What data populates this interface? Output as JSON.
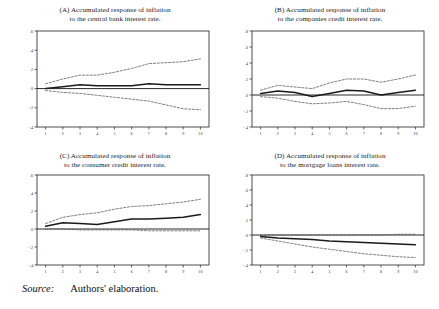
{
  "figure": {
    "source_label": "Source:",
    "source_value": "Authors' elaboration.",
    "background": "#ffffff",
    "line_color": "#1a1a1a",
    "band_color": "#555555"
  },
  "chart_data": [
    {
      "id": "A",
      "type": "line",
      "title_line1": "(A) Accumulated response of inflation",
      "title_line2": "to the central bank interest rate.",
      "xlabel": "",
      "ylabel": "",
      "x": [
        1,
        2,
        3,
        4,
        5,
        6,
        7,
        8,
        9,
        10
      ],
      "xtick_labels": [
        "1",
        "2",
        "3",
        "4",
        "5",
        "6",
        "7",
        "8",
        "9",
        "10"
      ],
      "ytick_labels": [
        ".6",
        ".4",
        ".2",
        ".0",
        "-.2",
        "-.4"
      ],
      "ylim": [
        -0.4,
        0.6
      ],
      "xlim": [
        0.5,
        10.5
      ],
      "grid": false,
      "legend": "none",
      "zero_line": 0.0,
      "series": [
        {
          "name": "Upper 2 S.E. band",
          "style": "dashed",
          "values": [
            0.05,
            0.1,
            0.14,
            0.14,
            0.17,
            0.21,
            0.26,
            0.27,
            0.28,
            0.31
          ]
        },
        {
          "name": "Accumulated response",
          "style": "solid",
          "values": [
            0.0,
            0.02,
            0.04,
            0.03,
            0.03,
            0.03,
            0.05,
            0.04,
            0.04,
            0.04
          ]
        },
        {
          "name": "Lower 2 S.E. band",
          "style": "dashed",
          "values": [
            -0.02,
            -0.04,
            -0.05,
            -0.07,
            -0.09,
            -0.11,
            -0.13,
            -0.17,
            -0.21,
            -0.22
          ]
        }
      ]
    },
    {
      "id": "B",
      "type": "line",
      "title_line1": "(B) Accumulated response of inflation",
      "title_line2": "to the companies credit interest rate.",
      "xlabel": "",
      "ylabel": "",
      "x": [
        1,
        2,
        3,
        4,
        5,
        6,
        7,
        8,
        9,
        10
      ],
      "xtick_labels": [
        "1",
        "2",
        "3",
        "4",
        "5",
        "6",
        "7",
        "8",
        "9",
        "10"
      ],
      "ytick_labels": [
        ".8",
        ".6",
        ".4",
        ".2",
        ".0",
        "-.2",
        "-.4"
      ],
      "ylim": [
        -0.4,
        0.8
      ],
      "xlim": [
        0.5,
        10.5
      ],
      "grid": false,
      "legend": "none",
      "zero_line": 0.0,
      "series": [
        {
          "name": "Upper 2 S.E. band",
          "style": "dashed",
          "values": [
            0.06,
            0.12,
            0.1,
            0.08,
            0.15,
            0.2,
            0.2,
            0.16,
            0.2,
            0.25
          ]
        },
        {
          "name": "Accumulated response",
          "style": "solid",
          "values": [
            0.02,
            0.05,
            0.03,
            -0.02,
            0.02,
            0.06,
            0.05,
            0.0,
            0.03,
            0.06
          ]
        },
        {
          "name": "Lower 2 S.E. band",
          "style": "dashed",
          "values": [
            -0.02,
            -0.04,
            -0.08,
            -0.11,
            -0.1,
            -0.08,
            -0.12,
            -0.17,
            -0.17,
            -0.14
          ]
        }
      ]
    },
    {
      "id": "C",
      "type": "line",
      "title_line1": "(C) Accumulated response of inflation",
      "title_line2": "to the consumer credit interest rate.",
      "xlabel": "",
      "ylabel": "",
      "x": [
        1,
        2,
        3,
        4,
        5,
        6,
        7,
        8,
        9,
        10
      ],
      "xtick_labels": [
        "1",
        "2",
        "3",
        "4",
        "5",
        "6",
        "7",
        "8",
        "9",
        "10"
      ],
      "ytick_labels": [
        ".6",
        ".4",
        ".2",
        ".0",
        "-.2",
        "-.4"
      ],
      "ylim": [
        -0.4,
        0.6
      ],
      "xlim": [
        0.5,
        10.5
      ],
      "grid": false,
      "legend": "none",
      "zero_line": 0.0,
      "series": [
        {
          "name": "Upper 2 S.E. band",
          "style": "dashed",
          "values": [
            0.06,
            0.13,
            0.16,
            0.18,
            0.22,
            0.25,
            0.26,
            0.28,
            0.3,
            0.33
          ]
        },
        {
          "name": "Accumulated response",
          "style": "solid",
          "values": [
            0.03,
            0.07,
            0.06,
            0.05,
            0.08,
            0.11,
            0.11,
            0.12,
            0.13,
            0.16
          ]
        },
        {
          "name": "Lower 2 S.E. band",
          "style": "dashed",
          "values": [
            0.0,
            0.0,
            -0.01,
            -0.01,
            -0.01,
            -0.01,
            -0.02,
            -0.02,
            -0.02,
            -0.02
          ]
        }
      ]
    },
    {
      "id": "D",
      "type": "line",
      "title_line1": "(D) Accumulated response of inflation",
      "title_line2": "to the mortgage loans interest rate.",
      "xlabel": "",
      "ylabel": "",
      "x": [
        1,
        2,
        3,
        4,
        5,
        6,
        7,
        8,
        9,
        10
      ],
      "xtick_labels": [
        "1",
        "2",
        "3",
        "4",
        "5",
        "6",
        "7",
        "8",
        "9",
        "10"
      ],
      "ytick_labels": [
        ".8",
        ".6",
        ".4",
        ".2",
        ".0",
        "-.2",
        "-.4"
      ],
      "ylim": [
        -0.4,
        0.8
      ],
      "xlim": [
        0.5,
        10.5
      ],
      "grid": false,
      "legend": "none",
      "zero_line": 0.0,
      "series": [
        {
          "name": "Upper 2 S.E. band",
          "style": "dashed",
          "values": [
            0.0,
            0.0,
            0.0,
            0.0,
            0.0,
            0.0,
            0.0,
            0.0,
            0.01,
            0.01
          ]
        },
        {
          "name": "Accumulated response",
          "style": "solid",
          "values": [
            -0.02,
            -0.04,
            -0.05,
            -0.06,
            -0.08,
            -0.09,
            -0.1,
            -0.11,
            -0.12,
            -0.13
          ]
        },
        {
          "name": "Lower 2 S.E. band",
          "style": "dashed",
          "values": [
            -0.04,
            -0.08,
            -0.12,
            -0.16,
            -0.19,
            -0.22,
            -0.25,
            -0.27,
            -0.29,
            -0.3
          ]
        }
      ]
    }
  ]
}
